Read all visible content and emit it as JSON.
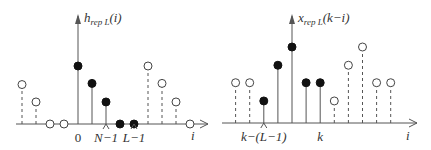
{
  "panels": [
    {
      "id": "left",
      "ylabel_main": "h",
      "ylabel_sub": "rep L",
      "ylabel_arg": "(i)",
      "xlabel": "i",
      "markers": [
        {
          "label": "0",
          "index": 0,
          "caret": false
        },
        {
          "label": "N−1",
          "index": 2,
          "caret": true
        },
        {
          "label": "L−1",
          "index": 4,
          "caret": true
        }
      ],
      "samples": [
        {
          "index": -4,
          "value": 0.68,
          "filled": false
        },
        {
          "index": -3,
          "value": 0.38,
          "filled": false
        },
        {
          "index": -2,
          "value": 0.0,
          "filled": false
        },
        {
          "index": -1,
          "value": 0.0,
          "filled": false
        },
        {
          "index": 0,
          "value": 1.0,
          "filled": true
        },
        {
          "index": 1,
          "value": 0.7,
          "filled": true
        },
        {
          "index": 2,
          "value": 0.38,
          "filled": true
        },
        {
          "index": 3,
          "value": 0.0,
          "filled": true
        },
        {
          "index": 4,
          "value": 0.0,
          "filled": true
        },
        {
          "index": 5,
          "value": 1.0,
          "filled": false
        },
        {
          "index": 6,
          "value": 0.7,
          "filled": false
        },
        {
          "index": 7,
          "value": 0.38,
          "filled": false
        },
        {
          "index": 8,
          "value": 0.0,
          "filled": false
        }
      ]
    },
    {
      "id": "right",
      "ylabel_main": "x",
      "ylabel_sub": "rep L",
      "ylabel_arg": "(k−i)",
      "xlabel": "i",
      "markers": [
        {
          "label": "k−(L−1)",
          "index": -2,
          "caret": true
        },
        {
          "label": "k",
          "index": 2,
          "caret": false
        }
      ],
      "samples": [
        {
          "index": -4,
          "value": 0.53,
          "filled": false
        },
        {
          "index": -3,
          "value": 0.53,
          "filled": false
        },
        {
          "index": -2,
          "value": 0.29,
          "filled": true
        },
        {
          "index": -1,
          "value": 0.76,
          "filled": true
        },
        {
          "index": 0,
          "value": 1.0,
          "filled": true
        },
        {
          "index": 1,
          "value": 0.53,
          "filled": true
        },
        {
          "index": 2,
          "value": 0.53,
          "filled": true
        },
        {
          "index": 3,
          "value": 0.29,
          "filled": false
        },
        {
          "index": 4,
          "value": 0.76,
          "filled": false
        },
        {
          "index": 5,
          "value": 1.0,
          "filled": false
        },
        {
          "index": 6,
          "value": 0.53,
          "filled": false
        },
        {
          "index": 7,
          "value": 0.53,
          "filled": false
        }
      ]
    }
  ]
}
